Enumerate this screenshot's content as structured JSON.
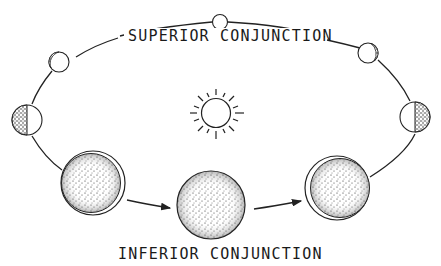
{
  "labels": {
    "top": "SUPERIOR CONJUNCTION",
    "bottom": "INFERIOR CONJUNCTION"
  },
  "center_body": {
    "name": "Sun",
    "icon": "sun-icon"
  },
  "planet_phases": [
    {
      "name": "superior-conjunction",
      "phase": "full"
    },
    {
      "name": "upper-right",
      "phase": "gibbous"
    },
    {
      "name": "right",
      "phase": "half"
    },
    {
      "name": "lower-right",
      "phase": "crescent"
    },
    {
      "name": "inferior-conjunction",
      "phase": "new"
    },
    {
      "name": "lower-left",
      "phase": "crescent"
    },
    {
      "name": "left",
      "phase": "half"
    },
    {
      "name": "upper-left",
      "phase": "gibbous"
    }
  ],
  "arrows": [
    "lower-left-to-inferior",
    "inferior-to-lower-right"
  ],
  "colors": {
    "ink": "#222222",
    "background": "#ffffff"
  }
}
